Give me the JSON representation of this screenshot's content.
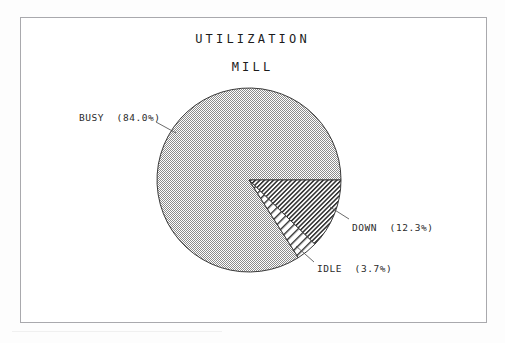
{
  "chart_data": {
    "type": "pie",
    "title": "UTILIZATION",
    "subtitle": "MILL",
    "categories": [
      "BUSY",
      "DOWN",
      "IDLE"
    ],
    "values": [
      84.0,
      12.3,
      3.7
    ],
    "value_unit": "%",
    "slices": [
      {
        "name": "BUSY",
        "value": 84.0,
        "label": "BUSY  (84.0%)",
        "fill_pattern": "stipple-checkerboard",
        "fill_color": "#8c8c8c",
        "start_angle_deg": 57.6,
        "end_angle_deg": 360.0
      },
      {
        "name": "DOWN",
        "value": 12.3,
        "label": "DOWN  (12.3%)",
        "fill_pattern": "diagonal-hatch-dense",
        "fill_color": "#2b2b2b",
        "start_angle_deg": 0.0,
        "end_angle_deg": 44.28
      },
      {
        "name": "IDLE",
        "value": 3.7,
        "label": "IDLE  (3.7%)",
        "fill_pattern": "diagonal-hatch-sparse",
        "fill_color": "#2b2b2b",
        "start_angle_deg": 44.28,
        "end_angle_deg": 57.6
      }
    ],
    "legend": "inline-callouts",
    "legend_position": "attached-to-slices",
    "grid": false,
    "xlabel": "",
    "ylabel": "",
    "direction": "clockwise",
    "start_at_clock": "3-oclock",
    "center": {
      "x": 249,
      "y": 180
    },
    "radius": 92
  },
  "frame": {
    "border_color": "#a9a9ad",
    "background": "#ffffff"
  },
  "labels": {
    "busy": "BUSY  (84.0%)",
    "down": "DOWN  (12.3%)",
    "idle": "IDLE  (3.7%)"
  },
  "colors": {
    "ink": "#1c1c1c",
    "label_ink": "#2b2b2b",
    "frame": "#a9a9ad",
    "paper": "#fdfdfd",
    "stipple": "#8c8c8c",
    "hatch": "#2b2b2b"
  }
}
